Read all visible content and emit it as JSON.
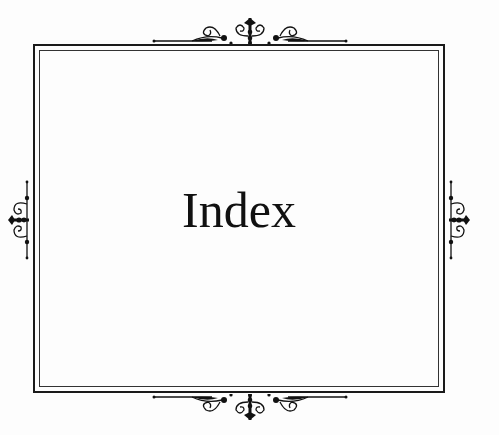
{
  "page": {
    "title": "Index"
  },
  "ornaments": {
    "top": "scroll-ornament-top",
    "bottom": "scroll-ornament-bottom",
    "left": "scroll-ornament-left",
    "right": "scroll-ornament-right"
  },
  "colors": {
    "background": "#fdfdfd",
    "ink": "#111111"
  }
}
